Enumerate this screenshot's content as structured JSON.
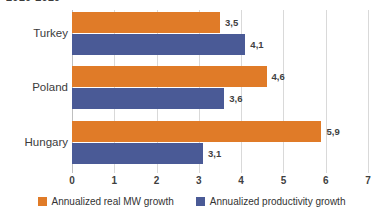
{
  "chart_data": {
    "type": "bar",
    "orientation": "horizontal",
    "title": "2010-2019",
    "xlabel": "",
    "ylabel": "",
    "categories": [
      "Turkey",
      "Poland",
      "Hungary"
    ],
    "xlim": [
      0,
      7
    ],
    "xticks": [
      "0",
      "1",
      "2",
      "3",
      "4",
      "5",
      "6",
      "7"
    ],
    "grid": true,
    "legend_position": "bottom",
    "decimal_separator": ",",
    "series": [
      {
        "name": "Annualized real MW growth",
        "key": "series-mw",
        "color": "#E07B28",
        "values": [
          3.5,
          4.6,
          5.9
        ],
        "labels": [
          "3,5",
          "4,6",
          "5,9"
        ]
      },
      {
        "name": "Annualized productivity growth",
        "key": "series-prod",
        "color": "#4A5A96",
        "values": [
          4.1,
          3.6,
          3.1
        ],
        "labels": [
          "4,1",
          "3,6",
          "3,1"
        ]
      }
    ]
  },
  "colors": {
    "series_mw": "#E07B28",
    "series_prod": "#4A5A96",
    "gridline": "#d9d9d9",
    "text": "#3b3b3b",
    "background": "#ffffff"
  }
}
